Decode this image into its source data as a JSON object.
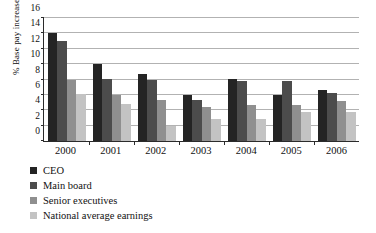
{
  "chart_data": {
    "type": "bar",
    "title": "",
    "xlabel": "",
    "ylabel": "% Base pay increase",
    "ylim": [
      0,
      16
    ],
    "yticks": [
      0,
      2,
      4,
      6,
      8,
      10,
      12,
      14,
      16
    ],
    "grid": true,
    "legend_position": "below-left",
    "categories": [
      "2000",
      "2001",
      "2002",
      "2003",
      "2004",
      "2005",
      "2006"
    ],
    "series": [
      {
        "name": "CEO",
        "color": "#242424",
        "values": [
          14.1,
          10.0,
          8.7,
          6.0,
          8.1,
          6.0,
          6.7
        ]
      },
      {
        "name": "Main board",
        "color": "#4c4c4c",
        "values": [
          13.0,
          8.1,
          7.9,
          5.4,
          7.8,
          7.8,
          6.2
        ]
      },
      {
        "name": "Senior executives",
        "color": "#8f8f8f",
        "values": [
          7.9,
          6.0,
          5.3,
          4.4,
          4.7,
          4.7,
          5.2
        ]
      },
      {
        "name": "National average earnings",
        "color": "#c3c3c3",
        "values": [
          6.1,
          4.8,
          1.9,
          2.9,
          2.9,
          3.8,
          3.8
        ]
      }
    ]
  }
}
